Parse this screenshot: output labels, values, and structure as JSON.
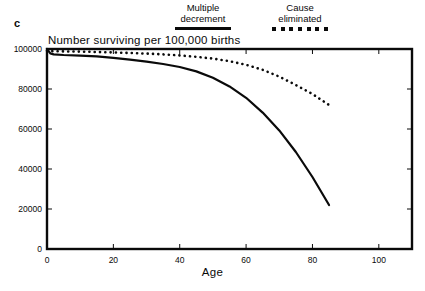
{
  "figure": {
    "panel_letter": "c",
    "legend": [
      {
        "name": "multiple-decrement",
        "line1": "Multiple",
        "line2": "decrement",
        "key": "solid-line"
      },
      {
        "name": "cause-eliminated",
        "line1": "Cause",
        "line2": "eliminated",
        "key": "dotted-line"
      }
    ]
  },
  "chart_data": {
    "type": "line",
    "title": "Number  surviving per 100,000 births",
    "xlabel": "Age",
    "ylabel": "Number surviving per 100,000 births",
    "xlim": [
      0,
      110
    ],
    "ylim": [
      0,
      100000
    ],
    "xticks": [
      0,
      20,
      40,
      60,
      80,
      100
    ],
    "xtick_labels": [
      "0",
      "20",
      "40",
      "60",
      "80",
      "100"
    ],
    "yticks": [
      0,
      20000,
      40000,
      60000,
      80000,
      100000
    ],
    "ytick_labels": [
      "0",
      "20000",
      "40000",
      "60000",
      "80000",
      "100000"
    ],
    "grid": false,
    "legend_position": "above-plot",
    "series": [
      {
        "name": "Multiple decrement",
        "style": "solid",
        "color": "#0a0a0a",
        "x": [
          0,
          1,
          2,
          5,
          10,
          15,
          20,
          25,
          30,
          35,
          40,
          45,
          50,
          55,
          60,
          65,
          70,
          75,
          80,
          85
        ],
        "values": [
          100000,
          97800,
          97300,
          97000,
          96700,
          96300,
          95600,
          94700,
          93700,
          92500,
          91000,
          88800,
          85600,
          81300,
          75600,
          68200,
          59300,
          48500,
          36000,
          22000
        ]
      },
      {
        "name": "Cause eliminated",
        "style": "dotted",
        "color": "#0a0a0a",
        "x": [
          0,
          1,
          2,
          5,
          10,
          15,
          20,
          25,
          30,
          35,
          40,
          45,
          50,
          55,
          60,
          65,
          70,
          75,
          80,
          85
        ],
        "values": [
          99200,
          99000,
          98900,
          98800,
          98700,
          98500,
          98300,
          98000,
          97700,
          97300,
          96800,
          96100,
          95200,
          93900,
          92100,
          89600,
          86200,
          82000,
          77500,
          72000
        ]
      }
    ]
  }
}
